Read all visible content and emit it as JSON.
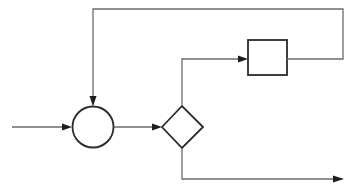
{
  "diagram": {
    "type": "flowchart",
    "colors": {
      "background": "#ffffff",
      "line": "#6b6b6b",
      "shape_stroke": "#2a2a2a",
      "arrowhead": "#1e1e1e"
    },
    "nodes": [
      {
        "id": "junction",
        "shape": "circle",
        "label": ""
      },
      {
        "id": "decision",
        "shape": "diamond",
        "label": ""
      },
      {
        "id": "process",
        "shape": "rectangle",
        "label": ""
      }
    ],
    "edges": [
      {
        "from": "input",
        "to": "junction",
        "label": ""
      },
      {
        "from": "junction",
        "to": "decision",
        "label": ""
      },
      {
        "from": "decision",
        "to": "process",
        "label": ""
      },
      {
        "from": "process",
        "to": "junction",
        "label": "",
        "kind": "feedback"
      },
      {
        "from": "decision",
        "to": "output",
        "label": ""
      }
    ]
  }
}
